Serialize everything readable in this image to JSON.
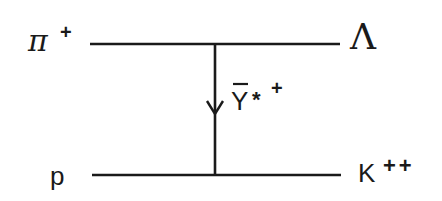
{
  "diagram": {
    "type": "feynman-diagram",
    "colors": {
      "line": "#1a1a1a",
      "background": "#ffffff"
    },
    "incoming": {
      "top": {
        "particle": "π",
        "charge": "+"
      },
      "bottom": {
        "particle": "p",
        "charge": ""
      }
    },
    "outgoing": {
      "top": {
        "particle": "Λ",
        "charge": ""
      },
      "bottom": {
        "particle": "K",
        "charge": "++"
      }
    },
    "exchange": {
      "particle": "Y",
      "modifier": "*",
      "charge": "+",
      "antiparticle_bar": true,
      "arrow_direction": "down"
    }
  }
}
